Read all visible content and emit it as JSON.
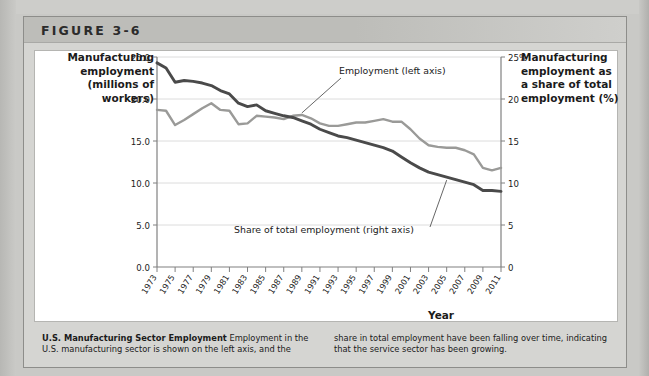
{
  "figure": {
    "label": "FIGURE 3-6"
  },
  "axis_titles": {
    "left": "Manufacturing employment (millions of workers)",
    "right": "Manufacturing employment as a share of total employment (%)",
    "x": "Year"
  },
  "caption": {
    "title": "U.S. Manufacturing Sector Employment",
    "body_left": "Employment in the U.S. manufacturing sector is shown on the left axis, and the",
    "body_right": "share in total employment have been falling over time, indicating that the service sector has been growing."
  },
  "colors": {
    "series_employment": "#9a9a98",
    "series_share": "#4a4a4a",
    "gridline": "#dcdcdc",
    "axis": "#808080",
    "header_bar": "#bdbdb9",
    "panel": "#d5d5d2",
    "page": "#c9c9c6"
  },
  "chart_data": {
    "type": "line",
    "title": "U.S. Manufacturing Sector Employment",
    "xlabel": "Year",
    "ylabel": "Manufacturing employment (millions of workers)",
    "y2label": "Manufacturing employment as a share of total employment (%)",
    "grid": true,
    "legend_position": "inline-annotations",
    "xlim": [
      1973,
      2011
    ],
    "ylim": [
      0.0,
      25.0
    ],
    "y2lim": [
      0,
      25
    ],
    "yticks": [
      "0.0",
      "5.0",
      "10.0",
      "15.0",
      "20.0",
      "25.0"
    ],
    "y2ticks": [
      "0",
      "5",
      "10",
      "15",
      "20",
      "25%"
    ],
    "x": [
      1973,
      1974,
      1975,
      1976,
      1977,
      1978,
      1979,
      1980,
      1981,
      1982,
      1983,
      1984,
      1985,
      1986,
      1987,
      1988,
      1989,
      1990,
      1991,
      1992,
      1993,
      1994,
      1995,
      1996,
      1997,
      1998,
      1999,
      2000,
      2001,
      2002,
      2003,
      2004,
      2005,
      2006,
      2007,
      2008,
      2009,
      2010,
      2011
    ],
    "xtick_labels": [
      "1973",
      "1975",
      "1977",
      "1979",
      "1981",
      "1983",
      "1985",
      "1987",
      "1989",
      "1991",
      "1993",
      "1995",
      "1997",
      "1999",
      "2001",
      "2003",
      "2005",
      "2007",
      "2009",
      "2011"
    ],
    "series": [
      {
        "name": "Employment (left axis)",
        "axis": "left",
        "units": "millions of workers",
        "color": "#9a9a98",
        "annotation": "Employment (left axis)",
        "values": [
          18.7,
          18.6,
          16.9,
          17.5,
          18.2,
          18.9,
          19.5,
          18.7,
          18.6,
          17.0,
          17.1,
          18.0,
          17.9,
          17.8,
          17.6,
          18.0,
          18.1,
          17.7,
          17.1,
          16.8,
          16.8,
          17.0,
          17.2,
          17.2,
          17.4,
          17.6,
          17.3,
          17.3,
          16.4,
          15.3,
          14.5,
          14.3,
          14.2,
          14.2,
          13.9,
          13.4,
          11.8,
          11.5,
          11.8
        ]
      },
      {
        "name": "Share of total employment (right axis)",
        "axis": "right",
        "units": "percent",
        "color": "#4a4a4a",
        "annotation": "Share of total employment (right axis)",
        "values": [
          24.3,
          23.7,
          22.0,
          22.2,
          22.1,
          21.9,
          21.6,
          21.0,
          20.6,
          19.5,
          19.1,
          19.3,
          18.6,
          18.3,
          18.0,
          17.8,
          17.4,
          17.0,
          16.4,
          16.0,
          15.6,
          15.4,
          15.1,
          14.8,
          14.5,
          14.2,
          13.8,
          13.1,
          12.4,
          11.8,
          11.3,
          11.0,
          10.7,
          10.4,
          10.1,
          9.8,
          9.1,
          9.1,
          9.0
        ]
      }
    ],
    "annotations": [
      {
        "text": "Employment (left axis)",
        "points_to_series": "Employment (left axis)",
        "near_year": 1989
      },
      {
        "text": "Share of total employment (right axis)",
        "points_to_series": "Share of total employment (right axis)",
        "near_year": 2005
      }
    ]
  }
}
